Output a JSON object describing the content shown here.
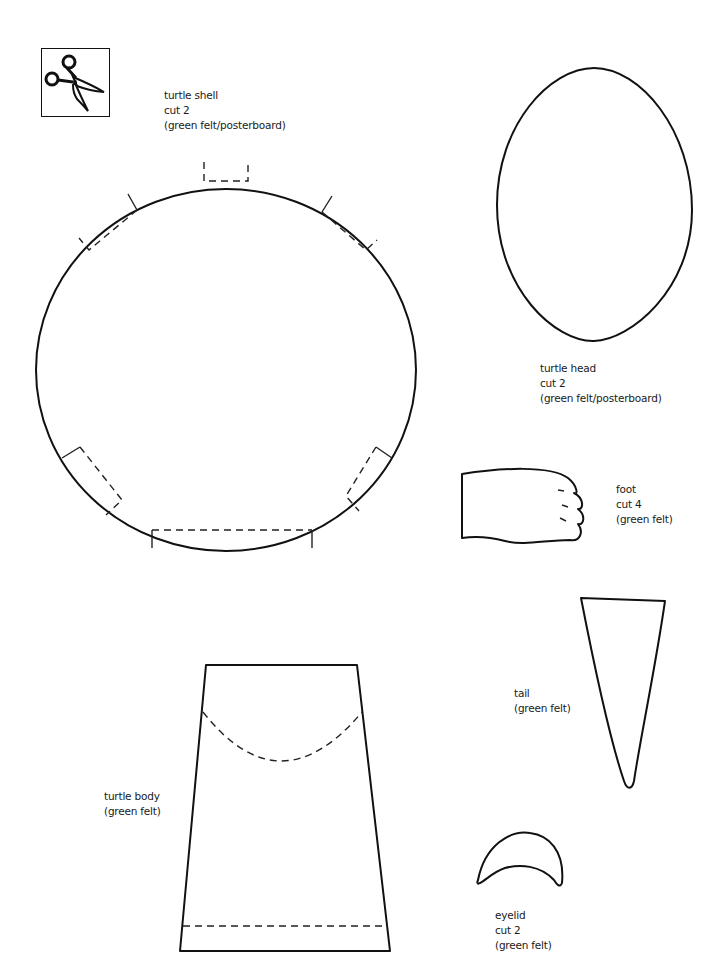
{
  "page": {
    "title_icon": "scissors-icon",
    "pieces": [
      {
        "name": "turtle shell",
        "lines": [
          "turtle shell",
          "cut 2",
          "(green felt/posterboard)"
        ]
      },
      {
        "name": "turtle head",
        "lines": [
          "turtle head",
          "cut 2",
          "(green felt/posterboard)"
        ]
      },
      {
        "name": "foot",
        "lines": [
          "foot",
          "cut 4",
          "(green felt)"
        ]
      },
      {
        "name": "tail",
        "lines": [
          "tail",
          "(green felt)"
        ]
      },
      {
        "name": "turtle body",
        "lines": [
          "turtle body",
          "(green felt)"
        ]
      },
      {
        "name": "eyelid",
        "lines": [
          "eyelid",
          "cut 2",
          "(green felt)"
        ]
      }
    ]
  }
}
